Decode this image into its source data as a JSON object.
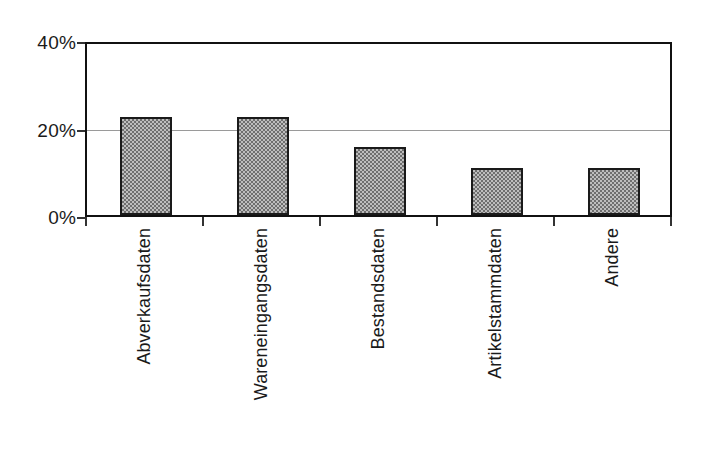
{
  "chart_data": {
    "type": "bar",
    "title": "",
    "subtitle": "",
    "xlabel": "",
    "ylabel": "",
    "categories": [
      "Abverkaufsdaten",
      "Wareneingangsdaten",
      "Bestandsdaten",
      "Artikelstammdaten",
      "Andere"
    ],
    "values": [
      23,
      23,
      16,
      11,
      11
    ],
    "value_labels": [
      "23%",
      "23%",
      "16%",
      "11%",
      "11%"
    ],
    "ylim": [
      0,
      40
    ],
    "ytick_labels": [
      "0%",
      "20%",
      "40%"
    ],
    "ytick_values": [
      0,
      20,
      40
    ],
    "grid": "horizontal-at-20-only",
    "legend": "none",
    "legend_position": "none",
    "bar_fill": "#8f8f8f",
    "bar_border": "#1a1a1a",
    "axis_color": "#111111",
    "gridline_color": "#9a9a9a",
    "background": "#ffffff",
    "annotations": []
  },
  "axes": {
    "y_ticks": [
      {
        "label": "40%",
        "value": 40
      },
      {
        "label": "20%",
        "value": 20
      },
      {
        "label": "0%",
        "value": 0
      }
    ]
  }
}
